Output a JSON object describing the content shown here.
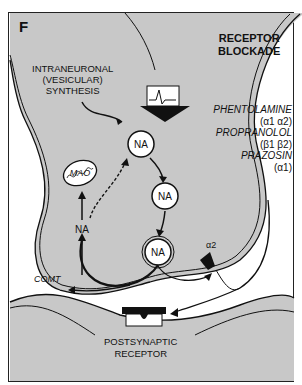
{
  "panel_label": "F",
  "title": {
    "line1": "RECEPTOR",
    "line2": "BLOCKADE"
  },
  "synthesis": {
    "line1": "INTRANEURONAL",
    "line2": "(VESICULAR)",
    "line3": "SYNTHESIS"
  },
  "drugs": [
    {
      "name": "PHENTOLAMINE",
      "targets": "(α1 α2)"
    },
    {
      "name": "PROPRANOLOL",
      "targets": "(β1 β2)"
    },
    {
      "name": "PRAZOSIN",
      "targets": "(α1)"
    }
  ],
  "vesicles": [
    {
      "label": "NA"
    },
    {
      "label": "NA"
    },
    {
      "label": "NA"
    }
  ],
  "cytoplasm_na": "NA",
  "mao_label": "MAO",
  "comt_label": "COMT",
  "presynaptic_receptor": "α2",
  "postsynaptic": {
    "line1": "POSTSYNAPTIC",
    "line2": "RECEPTOR"
  },
  "colors": {
    "neuron_fill": "#c8c8c8",
    "line": "#111111",
    "background": "#ffffff"
  }
}
